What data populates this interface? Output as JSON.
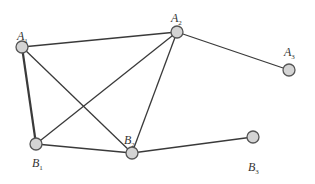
{
  "diagram": {
    "type": "graph",
    "nodes": [
      {
        "id": "A1",
        "letter": "A",
        "sub": "1",
        "x": 22,
        "y": 47,
        "lx": 17,
        "ly": 40
      },
      {
        "id": "A2",
        "letter": "A",
        "sub": "2",
        "x": 177,
        "y": 32,
        "lx": 171,
        "ly": 22
      },
      {
        "id": "A3",
        "letter": "A",
        "sub": "3",
        "x": 289,
        "y": 70,
        "lx": 284,
        "ly": 56
      },
      {
        "id": "B1",
        "letter": "B",
        "sub": "1",
        "x": 36,
        "y": 144,
        "lx": 32,
        "ly": 167
      },
      {
        "id": "B2",
        "letter": "B",
        "sub": "2",
        "x": 132,
        "y": 153,
        "lx": 124,
        "ly": 144
      },
      {
        "id": "B3",
        "letter": "B",
        "sub": "3",
        "x": 253,
        "y": 137,
        "lx": 248,
        "ly": 171
      }
    ],
    "edges": [
      {
        "from": "A1",
        "to": "A2",
        "thick": false
      },
      {
        "from": "A1",
        "to": "B1",
        "thick": true
      },
      {
        "from": "A1",
        "to": "B2",
        "thick": false
      },
      {
        "from": "A2",
        "to": "B1",
        "thick": false
      },
      {
        "from": "A2",
        "to": "B2",
        "thick": false
      },
      {
        "from": "A2",
        "to": "A3",
        "thick": false
      },
      {
        "from": "B1",
        "to": "B2",
        "thick": false
      },
      {
        "from": "B2",
        "to": "B3",
        "thick": false
      }
    ],
    "node_radius": 6,
    "colors": {
      "node_fill": "#d4d4d4",
      "node_stroke": "#555555",
      "edge": "#3a3a3a",
      "label": "#333333"
    }
  }
}
